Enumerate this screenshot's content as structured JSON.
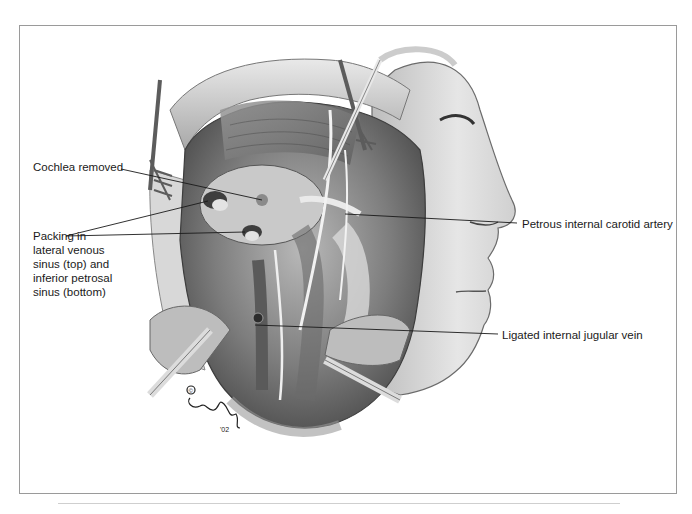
{
  "figure": {
    "type": "medical-illustration",
    "palette": {
      "background": "#ffffff",
      "frame_border": "#9a9a9a",
      "label_text": "#1a1a1a",
      "leader_line": "#1a1a1a",
      "tissue_dark": "#4a4a4a",
      "tissue_mid": "#8c8c8c",
      "tissue_light": "#d6d6d6",
      "skin": "#e8e8e8"
    },
    "signature": {
      "copyright_mark": "©",
      "year_mark": "'02"
    }
  },
  "labels": [
    {
      "id": "cochlea",
      "text": "Cochlea removed"
    },
    {
      "id": "packing",
      "lines": [
        "Packing in",
        "lateral venous",
        "sinus (top) and",
        "inferior petrosal",
        "sinus (bottom)"
      ]
    },
    {
      "id": "petrous",
      "text": "Petrous internal carotid artery"
    },
    {
      "id": "jugular",
      "text": "Ligated internal jugular vein"
    }
  ]
}
